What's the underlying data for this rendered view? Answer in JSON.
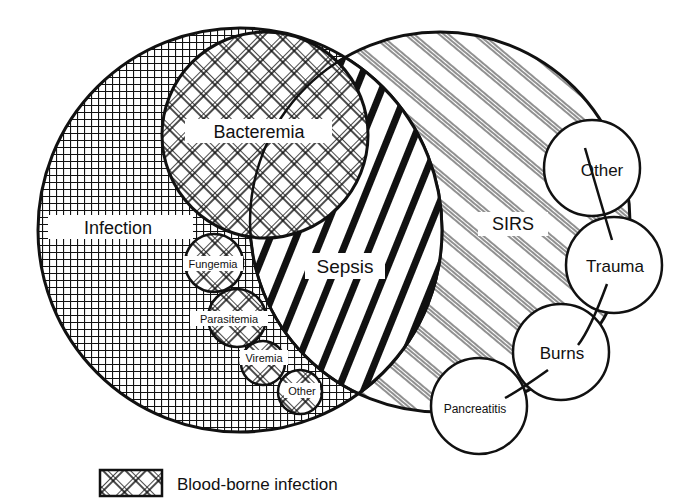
{
  "diagram": {
    "type": "venn",
    "sets": {
      "infection": "Infection",
      "sirs": "SIRS",
      "sepsis": "Sepsis",
      "bacteremia": "Bacteremia"
    },
    "blood_borne": {
      "fungemia": "Fungemia",
      "parasitemia": "Parasitemia",
      "viremia": "Viremia",
      "other": "Other"
    },
    "sirs_causes": {
      "other": "Other",
      "trauma": "Trauma",
      "burns": "Burns",
      "pancreatitis": "Pancreatitis"
    },
    "legend": {
      "label": "Blood-borne infection",
      "pattern": "diagonal-crosshatch"
    },
    "colors": {
      "ink": "#111111",
      "background": "#ffffff"
    }
  }
}
